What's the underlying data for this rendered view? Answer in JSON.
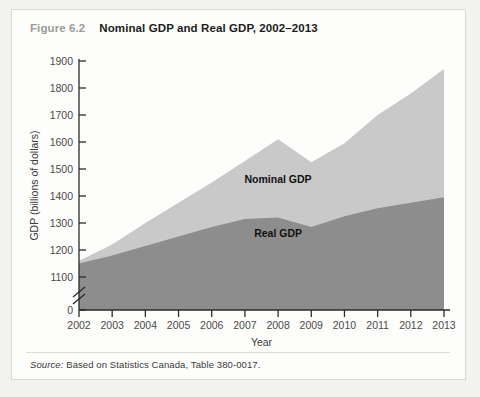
{
  "figure": {
    "number": "Figure 6.2",
    "title": "Nominal GDP and Real GDP, 2002–2013",
    "source_label": "Source:",
    "source_text": " Based on Statistics Canada, Table 380-0017."
  },
  "chart_data": {
    "type": "area",
    "title": "Nominal GDP and Real GDP, 2002–2013",
    "xlabel": "Year",
    "ylabel": "GDP (billions of dollars)",
    "x": [
      2002,
      2003,
      2004,
      2005,
      2006,
      2007,
      2008,
      2009,
      2010,
      2011,
      2012,
      2013
    ],
    "xtick_labels": [
      "2002",
      "2003",
      "2004",
      "2005",
      "2006",
      "2007",
      "2008",
      "2009",
      "2010",
      "2011",
      "2012",
      "2013"
    ],
    "ytick_labels": [
      "0",
      "1100",
      "1200",
      "1300",
      "1400",
      "1500",
      "1600",
      "1700",
      "1800",
      "1900"
    ],
    "ytick_values": [
      0,
      1100,
      1200,
      1300,
      1400,
      1500,
      1600,
      1700,
      1800,
      1900
    ],
    "ylim": [
      1075,
      1900
    ],
    "axis_break": true,
    "axis_break_note": "y-axis broken between 0 and 1100",
    "grid": false,
    "legend_position": "inline-annotation",
    "series": [
      {
        "name": "Nominal GDP",
        "color": "#c9c9c9",
        "label_x": 2008,
        "label_y": 1450,
        "values": [
          1160,
          1220,
          1300,
          1375,
          1450,
          1530,
          1610,
          1525,
          1595,
          1700,
          1780,
          1870
        ]
      },
      {
        "name": "Real GDP",
        "color": "#8d8d8d",
        "label_x": 2008,
        "label_y": 1250,
        "values": [
          1150,
          1180,
          1215,
          1250,
          1285,
          1315,
          1320,
          1285,
          1325,
          1355,
          1375,
          1395
        ]
      }
    ]
  }
}
